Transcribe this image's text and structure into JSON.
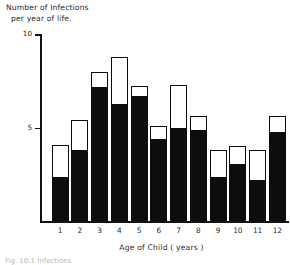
{
  "chart_data": {
    "type": "bar",
    "title": "",
    "ylabel_line1": "Number of Infections",
    "ylabel_line2": "per year of life.",
    "xlabel": "Age of Child ( years )",
    "categories": [
      "1",
      "2",
      "3",
      "4",
      "5",
      "6",
      "7",
      "8",
      "9",
      "10",
      "11",
      "12"
    ],
    "ylim": [
      0,
      10
    ],
    "yticks": [
      5,
      10
    ],
    "ytick_labels": [
      "5",
      "10"
    ],
    "grid": false,
    "legend": "none",
    "stacked": true,
    "series": [
      {
        "name": "lower (solid black)",
        "color": "#0d0d0d",
        "values": [
          2.4,
          3.8,
          7.2,
          6.3,
          6.7,
          4.4,
          5.0,
          4.9,
          2.4,
          3.1,
          2.2,
          4.8
        ]
      },
      {
        "name": "total (bar outline)",
        "color": "#ffffff",
        "values": [
          4.1,
          5.4,
          8.0,
          8.8,
          7.2,
          5.1,
          7.3,
          5.6,
          3.8,
          4.0,
          3.8,
          5.6
        ]
      }
    ]
  },
  "caption": "Fig. 10.1   Infections"
}
